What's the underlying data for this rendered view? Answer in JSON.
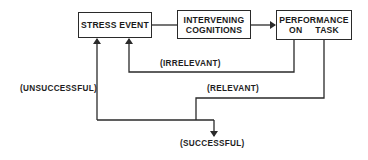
{
  "diagram": {
    "type": "flowchart",
    "nodes": [
      {
        "id": "stress_event",
        "lines": [
          "STRESS EVENT"
        ]
      },
      {
        "id": "intervening_cognitions",
        "lines": [
          "INTERVENING",
          "COGNITIONS"
        ]
      },
      {
        "id": "performance_on_task",
        "lines": [
          "PERFORMANCE",
          "ON     TASK"
        ]
      }
    ],
    "edges": [
      {
        "from": "stress_event",
        "to": "intervening_cognitions",
        "label": ""
      },
      {
        "from": "intervening_cognitions",
        "to": "performance_on_task",
        "label": ""
      },
      {
        "from": "performance_on_task",
        "to": "stress_event",
        "label": "(IRRELEVANT)"
      },
      {
        "from": "performance_on_task",
        "to": "branch",
        "label": "(RELEVANT)"
      },
      {
        "from": "branch",
        "to": "stress_event",
        "label": "(UNSUCCESSFUL)"
      },
      {
        "from": "branch",
        "to": "outcome",
        "label": "(SUCCESSFUL)"
      }
    ],
    "labels": {
      "irrelevant": "(IRRELEVANT)",
      "relevant": "(RELEVANT)",
      "unsuccessful": "(UNSUCCESSFUL)",
      "successful": "(SUCCESSFUL)"
    },
    "line_color": "#2a2a2a"
  }
}
